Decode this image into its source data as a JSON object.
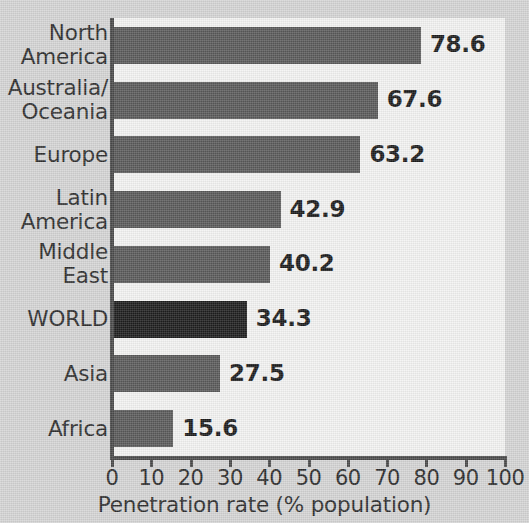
{
  "chart_data": {
    "type": "bar",
    "orientation": "horizontal",
    "title": "",
    "xlabel": "Penetration rate (% population)",
    "ylabel": "",
    "xlim": [
      0,
      100
    ],
    "grid": false,
    "legend": null,
    "categories": [
      "North\nAmerica",
      "Australia/\nOceania",
      "Europe",
      "Latin\nAmerica",
      "Middle\nEast",
      "WORLD",
      "Asia",
      "Africa"
    ],
    "values": [
      78.6,
      67.6,
      63.2,
      42.9,
      40.2,
      34.3,
      27.5,
      15.6
    ],
    "value_labels": [
      "78.6",
      "67.6",
      "63.2",
      "42.9",
      "40.2",
      "34.3",
      "27.5",
      "15.6"
    ],
    "highlight_category": "WORLD",
    "xticks": [
      0,
      10,
      20,
      30,
      40,
      50,
      60,
      70,
      80,
      90,
      100
    ],
    "xtick_labels": [
      "0",
      "10",
      "20",
      "30",
      "40",
      "50",
      "60",
      "70",
      "80",
      "90",
      "100"
    ],
    "colors": {
      "bar": "#5a5a5a",
      "bar_highlight": "#1e1e1e",
      "plot_background": "#f3f3f2",
      "figure_background": "#d5d5d5",
      "axis": "#4a4a4a",
      "text": "#2e2e2e",
      "value_text": "#1c1c1c"
    }
  }
}
